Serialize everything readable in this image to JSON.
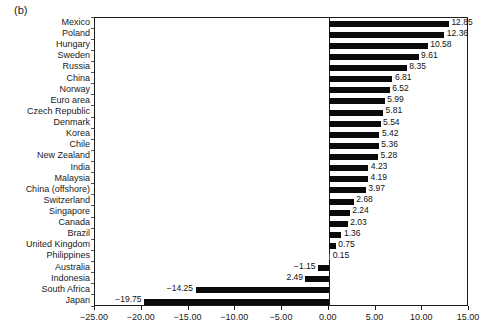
{
  "panel": {
    "label": "(b)"
  },
  "chart_data": {
    "type": "bar",
    "orientation": "horizontal",
    "title": "",
    "subtitle": "",
    "xlabel": "",
    "ylabel": "",
    "xlim": [
      -25.0,
      15.0
    ],
    "xticks": [
      -25.0,
      -20.0,
      -15.0,
      -10.0,
      -5.0,
      0.0,
      5.0,
      10.0,
      15.0
    ],
    "xtick_labels": [
      "-25.00",
      "-20.00",
      "-15.00",
      "-10.00",
      "-5.00",
      "0.00",
      "5.00",
      "10.00",
      "15.00"
    ],
    "grid": false,
    "legend": false,
    "zero_line": 0.0,
    "bar_color": "#0a0a0a",
    "categories": [
      "Mexico",
      "Poland",
      "Hungary",
      "Sweden",
      "Russia",
      "China",
      "Norway",
      "Euro area",
      "Czech Republic",
      "Denmark",
      "Korea",
      "Chile",
      "New Zealand",
      "India",
      "Malaysia",
      "China (offshore)",
      "Switzerland",
      "Singapore",
      "Canada",
      "Brazil",
      "United Kingdom",
      "Philippines",
      "Australia",
      "Indonesia",
      "South Africa",
      "Japan"
    ],
    "values": [
      12.85,
      12.36,
      10.58,
      9.61,
      8.35,
      6.81,
      6.52,
      5.99,
      5.81,
      5.54,
      5.42,
      5.36,
      5.28,
      4.23,
      4.19,
      3.97,
      2.68,
      2.24,
      2.03,
      1.36,
      0.75,
      0.15,
      -1.15,
      -2.49,
      -14.25,
      -19.75
    ],
    "data_labels": [
      "12.85",
      "12.36",
      "10.58",
      "9.61",
      "8.35",
      "6.81",
      "6.52",
      "5.99",
      "5.81",
      "5.54",
      "5.42",
      "5.36",
      "5.28",
      "4.23",
      "4.19",
      "3.97",
      "2.68",
      "2.24",
      "2.03",
      "1.36",
      "0.75",
      "0.15",
      "-1.15",
      "2.49",
      "-14.25",
      "-19.75"
    ]
  }
}
